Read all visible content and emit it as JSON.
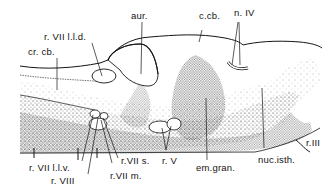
{
  "figure": {
    "type": "anatomical line drawing",
    "colors": {
      "ink": "#141414",
      "stipple": "#3a3a3a",
      "background": "#ffffff"
    }
  },
  "labels": {
    "aur": "aur.",
    "c_cb": "c.cb.",
    "n_iv": "n. IV",
    "r_vii_lld": "r. VII l.l.d.",
    "cr_cb": "cr. cb.",
    "r_vii_llv": "r. VII l.l.v.",
    "r_viii": "r. VIII",
    "r_vii_s": "r.VII s.",
    "r_vii_m": "r.VII m.",
    "r_v": "r. V",
    "em_gran": "em.gran.",
    "nuc_isth": "nuc.isth.",
    "r_iii": "r.III"
  }
}
